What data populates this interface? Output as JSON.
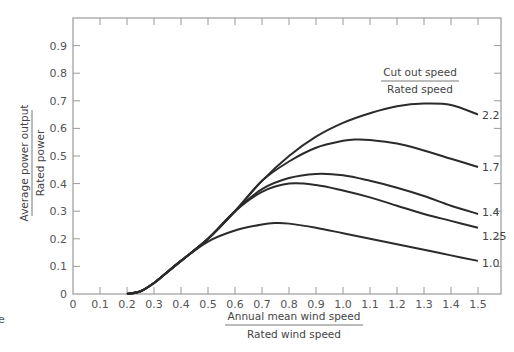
{
  "chart_data": {
    "type": "line",
    "title": "",
    "xlabel": {
      "numerator": "Annual mean wind speed",
      "denominator": "Rated wind speed"
    },
    "ylabel": {
      "numerator": "Average power output",
      "denominator": "Rated power"
    },
    "xlim": [
      0,
      1.6
    ],
    "ylim": [
      0,
      1.0
    ],
    "xticks": [
      "0",
      "0.1",
      "0.2",
      "0.3",
      "0.4",
      "0.5",
      "0.6",
      "0.7",
      "0.8",
      "0.9",
      "1.0",
      "1.1",
      "1.2",
      "1.3",
      "1.4",
      "1.5"
    ],
    "yticks": [
      "0",
      "0.1",
      "0.2",
      "0.3",
      "0.4",
      "0.5",
      "0.6",
      "0.7",
      "0.8",
      "0.9"
    ],
    "grid": false,
    "legend": {
      "title_numerator": "Cut out speed",
      "title_denominator": "Rated speed",
      "placement": "top-right"
    },
    "series": [
      {
        "name": "2.2",
        "x": [
          0.2,
          0.25,
          0.3,
          0.35,
          0.4,
          0.5,
          0.6,
          0.7,
          0.8,
          0.9,
          1.0,
          1.1,
          1.2,
          1.3,
          1.4,
          1.5
        ],
        "y": [
          0,
          0.01,
          0.04,
          0.08,
          0.12,
          0.2,
          0.3,
          0.41,
          0.5,
          0.57,
          0.62,
          0.655,
          0.68,
          0.69,
          0.685,
          0.65
        ]
      },
      {
        "name": "1.7",
        "x": [
          0.2,
          0.25,
          0.3,
          0.35,
          0.4,
          0.5,
          0.6,
          0.7,
          0.8,
          0.9,
          1.0,
          1.05,
          1.1,
          1.2,
          1.3,
          1.4,
          1.5
        ],
        "y": [
          0,
          0.01,
          0.04,
          0.08,
          0.12,
          0.2,
          0.3,
          0.41,
          0.48,
          0.53,
          0.555,
          0.56,
          0.558,
          0.545,
          0.52,
          0.49,
          0.46
        ]
      },
      {
        "name": "1.4",
        "x": [
          0.2,
          0.25,
          0.3,
          0.35,
          0.4,
          0.5,
          0.6,
          0.7,
          0.8,
          0.9,
          1.0,
          1.1,
          1.2,
          1.3,
          1.4,
          1.5
        ],
        "y": [
          0,
          0.01,
          0.04,
          0.08,
          0.12,
          0.2,
          0.3,
          0.38,
          0.42,
          0.435,
          0.43,
          0.41,
          0.385,
          0.355,
          0.32,
          0.29
        ]
      },
      {
        "name": "1.25",
        "x": [
          0.2,
          0.25,
          0.3,
          0.35,
          0.4,
          0.5,
          0.6,
          0.7,
          0.8,
          0.9,
          1.0,
          1.1,
          1.2,
          1.3,
          1.4,
          1.5
        ],
        "y": [
          0,
          0.01,
          0.04,
          0.08,
          0.12,
          0.2,
          0.3,
          0.37,
          0.4,
          0.395,
          0.375,
          0.35,
          0.32,
          0.29,
          0.265,
          0.24
        ]
      },
      {
        "name": "1.0",
        "x": [
          0.2,
          0.25,
          0.3,
          0.35,
          0.4,
          0.5,
          0.6,
          0.7,
          0.75,
          0.8,
          0.9,
          1.0,
          1.1,
          1.2,
          1.3,
          1.4,
          1.5
        ],
        "y": [
          0,
          0.01,
          0.04,
          0.08,
          0.12,
          0.19,
          0.23,
          0.252,
          0.257,
          0.255,
          0.24,
          0.22,
          0.2,
          0.18,
          0.16,
          0.14,
          0.12
        ]
      }
    ]
  },
  "caption_fragment": "e"
}
